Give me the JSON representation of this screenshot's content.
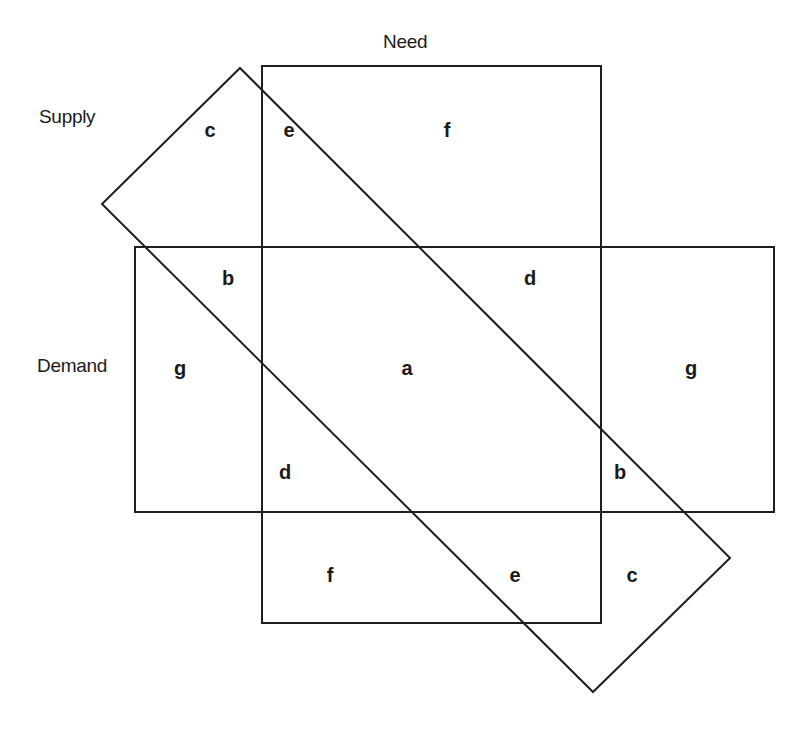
{
  "diagram": {
    "type": "overlapping-sets",
    "sets": [
      {
        "id": "need",
        "label": "Need",
        "shape": "rectangle",
        "x": 262,
        "y": 66,
        "width": 339,
        "height": 557
      },
      {
        "id": "demand",
        "label": "Demand",
        "shape": "rectangle",
        "x": 135,
        "y": 247,
        "width": 639,
        "height": 265
      },
      {
        "id": "supply",
        "label": "Supply",
        "shape": "rotated-rectangle",
        "points": "240,68 730,558 593,692 102,204"
      }
    ],
    "set_labels": {
      "need": {
        "text": "Need",
        "x": 383,
        "y": 42
      },
      "supply": {
        "text": "Supply",
        "x": 39,
        "y": 117
      },
      "demand": {
        "text": "Demand",
        "x": 37,
        "y": 366
      }
    },
    "regions": [
      {
        "id": "c-top",
        "label": "c",
        "x": 210,
        "y": 130
      },
      {
        "id": "e-top",
        "label": "e",
        "x": 289,
        "y": 130
      },
      {
        "id": "f-top",
        "label": "f",
        "x": 447,
        "y": 130
      },
      {
        "id": "b-upper-left",
        "label": "b",
        "x": 228,
        "y": 278
      },
      {
        "id": "d-upper-right",
        "label": "d",
        "x": 530,
        "y": 278
      },
      {
        "id": "g-left",
        "label": "g",
        "x": 180,
        "y": 368
      },
      {
        "id": "a-center",
        "label": "a",
        "x": 407,
        "y": 368
      },
      {
        "id": "g-right",
        "label": "g",
        "x": 691,
        "y": 368
      },
      {
        "id": "d-lower-left",
        "label": "d",
        "x": 285,
        "y": 472
      },
      {
        "id": "b-lower-right",
        "label": "b",
        "x": 620,
        "y": 472
      },
      {
        "id": "f-bottom",
        "label": "f",
        "x": 330,
        "y": 575
      },
      {
        "id": "e-bottom",
        "label": "e",
        "x": 515,
        "y": 575
      },
      {
        "id": "c-bottom",
        "label": "c",
        "x": 632,
        "y": 575
      }
    ],
    "colors": {
      "stroke": "#1e1e1e",
      "text": "#1a1a1a",
      "background": "#ffffff"
    }
  }
}
